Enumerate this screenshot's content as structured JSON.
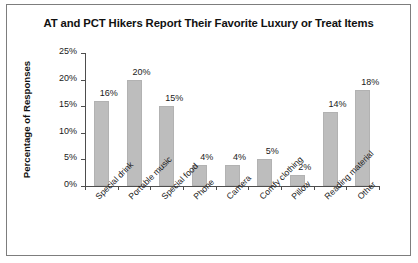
{
  "figure": {
    "title": "AT and PCT Hikers Report Their Favorite Luxury or Treat Items",
    "border_color": "#7d7d7d",
    "background": "#ffffff"
  },
  "chart_data": {
    "type": "bar",
    "title": "AT and PCT Hikers Report Their Favorite Luxury or Treat Items",
    "xlabel": "",
    "ylabel": "Percentage of Responses",
    "ylim": [
      0,
      25
    ],
    "ytick_labels": [
      "0%",
      "5%",
      "10%",
      "15%",
      "20%",
      "25%"
    ],
    "ytick_values": [
      0,
      5,
      10,
      15,
      20,
      25
    ],
    "grid": false,
    "legend": false,
    "bar_color": "#bdbdbd",
    "categories": [
      "Special drink",
      "Portable music",
      "Special food",
      "Phone",
      "Camera",
      "Comfy clothing",
      "Pillow",
      "Reading material",
      "Other"
    ],
    "values": [
      16,
      20,
      15,
      4,
      4,
      5,
      2,
      14,
      18
    ],
    "value_labels": [
      "16%",
      "20%",
      "15%",
      "4%",
      "4%",
      "5%",
      "2%",
      "14%",
      "18%"
    ]
  }
}
